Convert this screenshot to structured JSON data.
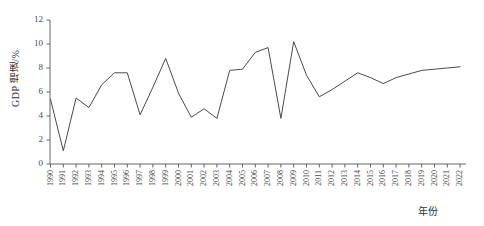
{
  "chart_data": {
    "type": "line",
    "title": "",
    "xlabel": "年份",
    "ylabel": "GDP 增速/%",
    "ylim": [
      0,
      12
    ],
    "yticks": [
      0,
      2,
      4,
      6,
      8,
      10,
      12
    ],
    "grid": false,
    "legend": null,
    "line_color": "#4a4a4a",
    "categories": [
      "1990",
      "1991",
      "1992",
      "1993",
      "1994",
      "1995",
      "1996",
      "1997",
      "1998",
      "1999",
      "2000",
      "2001",
      "2002",
      "2003",
      "2004",
      "2005",
      "2006",
      "2007",
      "2008",
      "2009",
      "2010",
      "2011",
      "2012",
      "2013",
      "2014",
      "2015",
      "2016",
      "2017",
      "2018",
      "2019",
      "2020",
      "2021",
      "2022"
    ],
    "x": [
      1990,
      1991,
      1992,
      1993,
      1994,
      1995,
      1996,
      1997,
      1998,
      1999,
      2000,
      2001,
      2002,
      2003,
      2004,
      2005,
      2006,
      2007,
      2008,
      2009,
      2010,
      2011,
      2012,
      2013,
      2014,
      2015,
      2016,
      2017,
      2018,
      2019,
      2020,
      2021,
      2022
    ],
    "values": [
      5.4,
      1.1,
      5.5,
      4.7,
      6.6,
      7.6,
      7.6,
      4.1,
      6.4,
      8.8,
      5.9,
      3.9,
      4.6,
      3.8,
      7.8,
      7.9,
      9.3,
      9.7,
      3.8,
      10.2,
      7.4,
      5.6,
      6.2,
      6.9,
      7.6,
      7.2,
      6.7,
      7.2,
      7.5,
      7.8,
      7.9,
      8.0,
      8.1
    ],
    "series": [
      {
        "name": "GDP 增速",
        "values": [
          5.4,
          1.1,
          5.5,
          4.7,
          6.6,
          7.6,
          7.6,
          4.1,
          6.4,
          8.8,
          5.9,
          3.9,
          4.6,
          3.8,
          7.8,
          7.9,
          9.3,
          9.7,
          3.8,
          10.2,
          7.4,
          5.6,
          6.2,
          6.9,
          7.6,
          7.2,
          6.7,
          7.2,
          7.5,
          7.8,
          7.9,
          8.0,
          8.1
        ]
      }
    ]
  }
}
